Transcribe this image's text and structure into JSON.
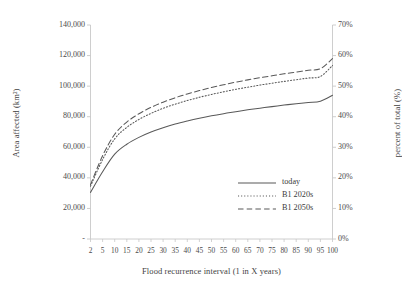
{
  "chart_data": {
    "type": "line",
    "title": "",
    "xlabel": "Flood recurrence interval (1 in X years)",
    "ylabel": "Area affected (km²)",
    "ylabel_secondary": "percent of total (%)",
    "x": [
      2,
      5,
      10,
      15,
      20,
      25,
      30,
      35,
      40,
      45,
      50,
      55,
      60,
      65,
      70,
      75,
      80,
      85,
      90,
      95,
      100
    ],
    "xtick_labels": [
      "2",
      "5",
      "10",
      "15",
      "20",
      "25",
      "30",
      "35",
      "40",
      "45",
      "50",
      "55",
      "60",
      "65",
      "70",
      "75",
      "80",
      "85",
      "90",
      "95",
      "100"
    ],
    "ytick_labels": [
      "-",
      "20,000",
      "40,000",
      "60,000",
      "80,000",
      "100,000",
      "120,000",
      "140,000"
    ],
    "ytick_values": [
      0,
      20000,
      40000,
      60000,
      80000,
      100000,
      120000,
      140000
    ],
    "ylim": [
      0,
      140000
    ],
    "ytick_labels_secondary": [
      "0%",
      "10%",
      "20%",
      "30%",
      "40%",
      "50%",
      "60%",
      "70%"
    ],
    "ytick_values_secondary": [
      0,
      10,
      20,
      30,
      40,
      50,
      60,
      70
    ],
    "ylim_secondary": [
      0,
      70
    ],
    "grid": false,
    "legend_position": "inside lower right",
    "series": [
      {
        "name": "today",
        "style": "solid",
        "color": "#595959",
        "values": [
          30500,
          44000,
          55500,
          62000,
          66500,
          70000,
          72800,
          75200,
          77200,
          79000,
          80600,
          82000,
          83300,
          84500,
          85600,
          86600,
          87600,
          88500,
          89300,
          90100,
          94000
        ]
      },
      {
        "name": "B1 2020s",
        "style": "dotted",
        "color": "#595959",
        "values": [
          34500,
          52000,
          65500,
          73000,
          78200,
          82200,
          85500,
          88200,
          90600,
          92700,
          94600,
          96300,
          97900,
          99300,
          100700,
          101900,
          103100,
          104200,
          105300,
          106300,
          113500
        ]
      },
      {
        "name": "B1 2050s",
        "style": "dashed",
        "color": "#595959",
        "values": [
          35500,
          54500,
          68500,
          76500,
          81900,
          86100,
          89500,
          92400,
          94900,
          97100,
          99100,
          100900,
          102600,
          104100,
          105500,
          106800,
          108100,
          109200,
          110400,
          111400,
          118000
        ]
      }
    ]
  },
  "legend": {
    "items": [
      {
        "label": "today",
        "style": "solid"
      },
      {
        "label": "B1 2020s",
        "style": "dotted"
      },
      {
        "label": "B1 2050s",
        "style": "dashed"
      }
    ]
  },
  "colors": {
    "line": "#595959",
    "axis": "#c8c8c8",
    "text": "#3f3f3f",
    "background": "#ffffff"
  }
}
